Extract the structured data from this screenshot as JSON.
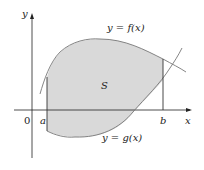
{
  "figure": {
    "region_label": "S",
    "top_curve_label": "y = f(x)",
    "bottom_curve_label": "y = g(x)",
    "x_axis_label": "x",
    "y_axis_label": "y",
    "origin_label": "0",
    "left_bound_label": "a",
    "right_bound_label": "b",
    "colors": {
      "fill": "#d9d9d9",
      "curve": "#777777",
      "axis": "#222222",
      "bound": "#333333"
    }
  }
}
